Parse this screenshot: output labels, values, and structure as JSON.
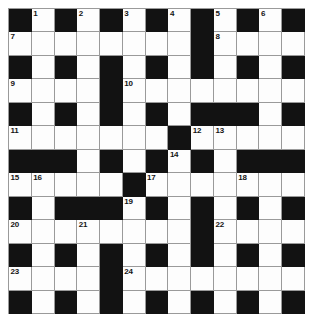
{
  "puzzle": {
    "title": "Crossword Grid",
    "type": "crossword",
    "rows": 13,
    "columns": 13,
    "colors": {
      "block": "#121212",
      "cell": "#fdfdfd",
      "gridline": "#9a9a9a",
      "number": "#141414",
      "page_background": "#ffffff"
    },
    "legend": {
      "block_symbol": "#",
      "open_symbol": "."
    },
    "grid": [
      "#.#.#.#.#.#.#",
      "........#....",
      "#.#.#.#.#.#.#",
      "....#........",
      "#.#.#.#.###.#",
      ".......#.....",
      "###.#.#.#.###",
      ".....#.......",
      "#.###.#.#.#.#",
      "........#....",
      "#.#.#.#.#.#.#",
      "....#........",
      "#.#.#.#.#.#.#"
    ],
    "numbers": [
      {
        "label": "1",
        "row": 1,
        "col": 2
      },
      {
        "label": "2",
        "row": 1,
        "col": 4
      },
      {
        "label": "3",
        "row": 1,
        "col": 6
      },
      {
        "label": "4",
        "row": 1,
        "col": 8
      },
      {
        "label": "5",
        "row": 1,
        "col": 10
      },
      {
        "label": "6",
        "row": 1,
        "col": 12
      },
      {
        "label": "7",
        "row": 2,
        "col": 1
      },
      {
        "label": "8",
        "row": 2,
        "col": 10
      },
      {
        "label": "9",
        "row": 4,
        "col": 1
      },
      {
        "label": "10",
        "row": 4,
        "col": 6
      },
      {
        "label": "11",
        "row": 6,
        "col": 1
      },
      {
        "label": "12",
        "row": 6,
        "col": 9
      },
      {
        "label": "13",
        "row": 6,
        "col": 10
      },
      {
        "label": "14",
        "row": 7,
        "col": 8
      },
      {
        "label": "15",
        "row": 8,
        "col": 1
      },
      {
        "label": "16",
        "row": 8,
        "col": 2
      },
      {
        "label": "17",
        "row": 8,
        "col": 7
      },
      {
        "label": "18",
        "row": 8,
        "col": 11
      },
      {
        "label": "19",
        "row": 9,
        "col": 6
      },
      {
        "label": "20",
        "row": 10,
        "col": 1
      },
      {
        "label": "21",
        "row": 10,
        "col": 4
      },
      {
        "label": "22",
        "row": 10,
        "col": 10
      },
      {
        "label": "23",
        "row": 12,
        "col": 1
      },
      {
        "label": "24",
        "row": 12,
        "col": 6
      }
    ]
  }
}
